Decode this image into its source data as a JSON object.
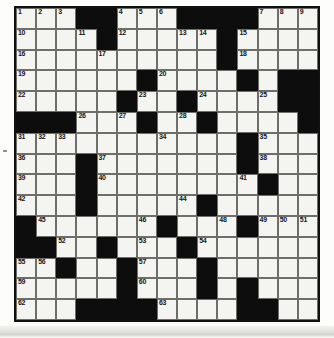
{
  "document": {
    "type": "crossword-puzzle-grid",
    "title": "Crossword Puzzle",
    "grid_size": {
      "rows": 15,
      "cols": 15
    },
    "colors": {
      "paper": "#fdfdfb",
      "cell_fill": "#f4f4f1",
      "block_fill": "#0d0d0d",
      "cell_border": "#6d6d6a",
      "outer_border": "#111111",
      "number_text": "#141414"
    },
    "highest_clue_number": 64,
    "grid_rows": [
      "...##...####...",
      "....#.....#....",
      "..........#....",
      "......#....#.##",
      ".....#..#....##",
      "###...#..#....#",
      "...........#...",
      "...#.......#...",
      "...#........#..",
      "...#.....#.....",
      "#......#...#...",
      "##..#...#......",
      "..#..#...#.....",
      ".....#...#.#...",
      "...####....##.."
    ],
    "numbers": [
      {
        "n": 1,
        "row": 1,
        "col": 1
      },
      {
        "n": 2,
        "row": 1,
        "col": 2
      },
      {
        "n": 3,
        "row": 1,
        "col": 3
      },
      {
        "n": 4,
        "row": 1,
        "col": 6
      },
      {
        "n": 5,
        "row": 1,
        "col": 7
      },
      {
        "n": 6,
        "row": 1,
        "col": 8
      },
      {
        "n": 7,
        "row": 1,
        "col": 13
      },
      {
        "n": 8,
        "row": 1,
        "col": 14
      },
      {
        "n": 9,
        "row": 1,
        "col": 15
      },
      {
        "n": 10,
        "row": 2,
        "col": 1
      },
      {
        "n": 11,
        "row": 2,
        "col": 4
      },
      {
        "n": 12,
        "row": 2,
        "col": 6
      },
      {
        "n": 13,
        "row": 2,
        "col": 9
      },
      {
        "n": 14,
        "row": 2,
        "col": 10
      },
      {
        "n": 15,
        "row": 2,
        "col": 12
      },
      {
        "n": 16,
        "row": 3,
        "col": 1
      },
      {
        "n": 17,
        "row": 3,
        "col": 5
      },
      {
        "n": 18,
        "row": 3,
        "col": 12
      },
      {
        "n": 19,
        "row": 4,
        "col": 1
      },
      {
        "n": 20,
        "row": 4,
        "col": 8
      },
      {
        "n": 21,
        "row": 4,
        "col": 12
      },
      {
        "n": 22,
        "row": 5,
        "col": 1
      },
      {
        "n": 23,
        "row": 5,
        "col": 7
      },
      {
        "n": 24,
        "row": 5,
        "col": 10
      },
      {
        "n": 25,
        "row": 5,
        "col": 13
      },
      {
        "n": 26,
        "row": 6,
        "col": 4
      },
      {
        "n": 27,
        "row": 6,
        "col": 6
      },
      {
        "n": 28,
        "row": 6,
        "col": 9
      },
      {
        "n": 29,
        "row": 6,
        "col": 10
      },
      {
        "n": 30,
        "row": 6,
        "col": 15
      },
      {
        "n": 31,
        "row": 7,
        "col": 1
      },
      {
        "n": 32,
        "row": 7,
        "col": 2
      },
      {
        "n": 33,
        "row": 7,
        "col": 3
      },
      {
        "n": 34,
        "row": 7,
        "col": 8
      },
      {
        "n": 35,
        "row": 7,
        "col": 13
      },
      {
        "n": 36,
        "row": 8,
        "col": 1
      },
      {
        "n": 37,
        "row": 8,
        "col": 5
      },
      {
        "n": 38,
        "row": 8,
        "col": 13
      },
      {
        "n": 39,
        "row": 9,
        "col": 1
      },
      {
        "n": 40,
        "row": 9,
        "col": 5
      },
      {
        "n": 41,
        "row": 9,
        "col": 12
      },
      {
        "n": 42,
        "row": 10,
        "col": 1
      },
      {
        "n": 43,
        "row": 10,
        "col": 4
      },
      {
        "n": 44,
        "row": 10,
        "col": 9
      },
      {
        "n": 45,
        "row": 11,
        "col": 2
      },
      {
        "n": 46,
        "row": 11,
        "col": 7
      },
      {
        "n": 47,
        "row": 11,
        "col": 8
      },
      {
        "n": 48,
        "row": 11,
        "col": 11
      },
      {
        "n": 49,
        "row": 11,
        "col": 13
      },
      {
        "n": 50,
        "row": 11,
        "col": 14
      },
      {
        "n": 51,
        "row": 11,
        "col": 15
      },
      {
        "n": 52,
        "row": 12,
        "col": 3
      },
      {
        "n": 53,
        "row": 12,
        "col": 7
      },
      {
        "n": 54,
        "row": 12,
        "col": 10
      },
      {
        "n": 55,
        "row": 13,
        "col": 1
      },
      {
        "n": 56,
        "row": 13,
        "col": 2
      },
      {
        "n": 57,
        "row": 13,
        "col": 7
      },
      {
        "n": 58,
        "row": 13,
        "col": 10
      },
      {
        "n": 59,
        "row": 14,
        "col": 1
      },
      {
        "n": 60,
        "row": 14,
        "col": 7
      },
      {
        "n": 61,
        "row": 14,
        "col": 12
      },
      {
        "n": 62,
        "row": 15,
        "col": 1
      },
      {
        "n": 63,
        "row": 15,
        "col": 8
      },
      {
        "n": 64,
        "row": 15,
        "col": 12
      }
    ]
  }
}
